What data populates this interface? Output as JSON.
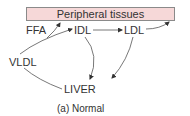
{
  "diagram": {
    "top_box": {
      "label": "Peripheral tissues",
      "fill": "#f6d8d8",
      "border": "#8a8a8a"
    },
    "nodes": [
      {
        "id": "ffa",
        "label": "FFA"
      },
      {
        "id": "idl",
        "label": "IDL"
      },
      {
        "id": "ldl",
        "label": "LDL"
      },
      {
        "id": "vldl",
        "label": "VLDL"
      },
      {
        "id": "liver",
        "label": "LIVER"
      }
    ],
    "edges": [
      {
        "from": "VLDL",
        "to": "Peripheral tissues",
        "via": "FFA"
      },
      {
        "from": "VLDL",
        "to": "IDL"
      },
      {
        "from": "IDL",
        "to": "LDL"
      },
      {
        "from": "LDL",
        "to": "Peripheral tissues"
      },
      {
        "from": "IDL",
        "to": "LIVER"
      },
      {
        "from": "LDL",
        "to": "LIVER"
      },
      {
        "from": "LIVER",
        "to": "VLDL"
      }
    ],
    "caption": "(a) Normal"
  }
}
